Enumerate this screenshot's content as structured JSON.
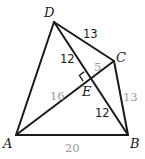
{
  "diagram": {
    "type": "geometry-quadrilateral",
    "vertices": {
      "A": {
        "label": "A",
        "x": 16,
        "y": 135
      },
      "B": {
        "label": "B",
        "x": 128,
        "y": 135
      },
      "C": {
        "label": "C",
        "x": 114,
        "y": 61
      },
      "D": {
        "label": "D",
        "x": 54,
        "y": 22
      },
      "E": {
        "label": "E",
        "x": 89,
        "y": 79
      }
    },
    "edges": [
      {
        "from": "A",
        "to": "B",
        "length": "20"
      },
      {
        "from": "B",
        "to": "C",
        "length": "13"
      },
      {
        "from": "C",
        "to": "D",
        "length": "13"
      },
      {
        "from": "D",
        "to": "A",
        "length": ""
      },
      {
        "from": "A",
        "to": "C",
        "note": "diagonal through E"
      },
      {
        "from": "D",
        "to": "B",
        "note": "diagonal through E"
      }
    ],
    "segment_labels": {
      "DE": "12",
      "CD": "13",
      "EC": "5",
      "AE": "16",
      "BC": "13",
      "EB": "12",
      "AB": "20"
    },
    "right_angle_at": "E",
    "colors": {
      "line": "#1a1a1a",
      "dark_label": "#1a1a1a",
      "light_label": "#9a9a9a"
    }
  }
}
